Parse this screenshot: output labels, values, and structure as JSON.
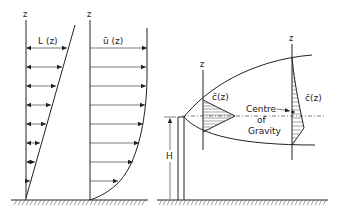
{
  "diagram": {
    "left_panel": {
      "axis_label": "z",
      "profile_label": "L (z)",
      "description": "Length scale profile L(z) increasing linearly with height"
    },
    "middle_panel": {
      "axis_label": "z",
      "profile_label": "ū (z)",
      "description": "Mean wind velocity profile ū(z)"
    },
    "right_panel": {
      "near_axis_label": "z",
      "near_profile_label": "c̄(z)",
      "far_axis_label": "z",
      "far_profile_label": "c̄(z)",
      "centre_label_line1": "Centre",
      "centre_label_line2": "of",
      "centre_label_line3": "Gravity",
      "height_label": "H",
      "description": "Plume from stack of height H with concentration profiles c̄(z)"
    }
  }
}
